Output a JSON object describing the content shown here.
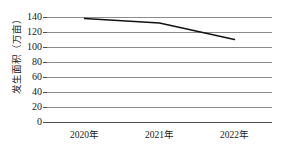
{
  "chart_data": {
    "type": "line",
    "title": "",
    "subtitle": "",
    "xlabel": "",
    "ylabel": "发生面积（万亩）",
    "categories": [
      "2020年",
      "2021年",
      "2022年"
    ],
    "series": [
      {
        "name": "发生面积",
        "values": [
          138,
          132,
          110
        ]
      }
    ],
    "yticks": [
      0,
      20,
      40,
      60,
      80,
      100,
      120,
      140
    ],
    "ytick_labels": [
      "0",
      "20",
      "40",
      "60",
      "80",
      "100",
      "120",
      "140"
    ],
    "ylim": [
      0,
      140
    ],
    "grid": true,
    "legend": "none",
    "line_color": "#111111",
    "grid_color": "#8c8c8c",
    "axis_color": "#4d4d4d",
    "background_color": "#ffffff"
  }
}
